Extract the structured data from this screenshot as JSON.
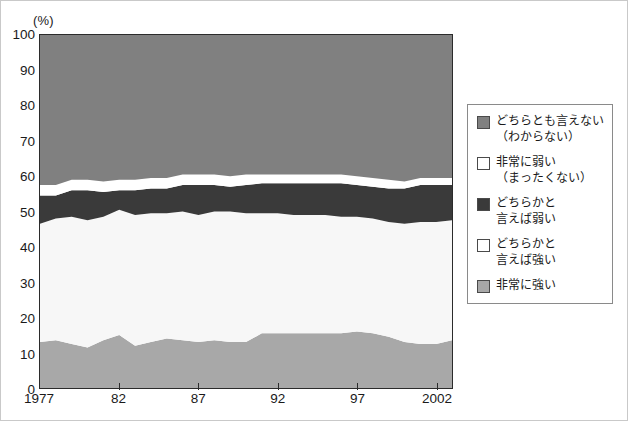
{
  "figure": {
    "unit_label": "(%)",
    "colors": {
      "band_dontknow": "#808080",
      "band_very_weak": "#ffffff",
      "band_somewhat_weak": "#3a3a3a",
      "band_somewhat_strong": "#f7f7f7",
      "band_very_strong": "#a8a8a8",
      "axis": "#2b2b2b",
      "legend_border": "#8a8a8a"
    }
  },
  "legend": {
    "items": [
      {
        "label": "どちらとも言えない\n（わからない）",
        "swatch": "#808080",
        "name": "legend-dontknow"
      },
      {
        "label": "非常に弱い\n（まったくない）",
        "swatch": "#ffffff",
        "name": "legend-very-weak"
      },
      {
        "label": "どちらかと\n言えば弱い",
        "swatch": "#3a3a3a",
        "name": "legend-somewhat-weak"
      },
      {
        "label": "どちらかと\n言えば強い",
        "swatch": "#ffffff",
        "name": "legend-somewhat-strong"
      },
      {
        "label": "非常に強い",
        "swatch": "#a8a8a8",
        "name": "legend-very-strong"
      }
    ]
  },
  "chart_data": {
    "type": "area",
    "stacked": true,
    "title": "",
    "subtitle": "",
    "xlabel": "",
    "ylabel": "(%)",
    "ylim": [
      0,
      100
    ],
    "xlim": [
      1977,
      2003
    ],
    "grid": false,
    "legend_position": "right",
    "y_ticks": [
      0,
      10,
      20,
      30,
      40,
      50,
      60,
      70,
      80,
      90,
      100
    ],
    "y_ticklabels": [
      "0",
      "10",
      "20",
      "30",
      "40",
      "50",
      "60",
      "70",
      "80",
      "90",
      "100"
    ],
    "x_ticks": [
      1977,
      1982,
      1987,
      1992,
      1997,
      2002
    ],
    "x_ticklabels": [
      "1977",
      "82",
      "87",
      "92",
      "97",
      "2002"
    ],
    "x": [
      1977,
      1978,
      1979,
      1980,
      1981,
      1982,
      1983,
      1984,
      1985,
      1986,
      1987,
      1988,
      1989,
      1990,
      1991,
      1992,
      1993,
      1994,
      1995,
      1996,
      1997,
      1998,
      1999,
      2000,
      2001,
      2002,
      2003
    ],
    "series": [
      {
        "name": "非常に強い",
        "color": "#a8a8a8",
        "stack_order": 1,
        "values": [
          13.0,
          13.5,
          12.5,
          11.5,
          13.5,
          15.0,
          12.0,
          13.0,
          14.0,
          13.5,
          13.0,
          13.5,
          13.0,
          13.0,
          15.5,
          15.5,
          15.5,
          15.5,
          15.5,
          15.5,
          16.0,
          15.5,
          14.5,
          13.0,
          12.5,
          12.5,
          13.5
        ]
      },
      {
        "name": "どちらかと言えば強い",
        "color": "#f7f7f7",
        "stack_order": 2,
        "values": [
          33.5,
          34.5,
          36.0,
          36.0,
          35.0,
          35.5,
          37.0,
          36.5,
          35.5,
          36.5,
          36.0,
          36.5,
          37.0,
          36.5,
          34.0,
          34.0,
          33.5,
          33.5,
          33.5,
          33.0,
          32.5,
          32.5,
          32.5,
          33.5,
          34.5,
          34.5,
          34.0
        ]
      },
      {
        "name": "どちらかと言えば弱い",
        "color": "#3a3a3a",
        "stack_order": 3,
        "values": [
          8.0,
          6.5,
          7.5,
          8.5,
          7.0,
          5.5,
          7.0,
          7.0,
          7.0,
          7.5,
          8.5,
          7.5,
          7.0,
          8.0,
          8.5,
          8.5,
          9.0,
          9.0,
          9.0,
          9.5,
          9.0,
          9.0,
          9.5,
          10.0,
          10.5,
          10.5,
          10.0
        ]
      },
      {
        "name": "非常に弱い",
        "color": "#ffffff",
        "stack_order": 4,
        "values": [
          3.0,
          3.0,
          3.0,
          3.0,
          3.0,
          3.0,
          3.0,
          3.0,
          3.0,
          3.0,
          3.0,
          3.0,
          3.0,
          3.0,
          2.5,
          2.5,
          2.5,
          2.5,
          2.5,
          2.5,
          2.5,
          2.5,
          2.5,
          2.0,
          2.0,
          2.0,
          2.0
        ]
      },
      {
        "name": "どちらとも言えない（わからない）",
        "color": "#808080",
        "stack_order": 5,
        "values": [
          42.5,
          42.5,
          41.0,
          41.0,
          41.5,
          41.0,
          41.0,
          40.5,
          40.5,
          39.5,
          39.5,
          39.5,
          40.0,
          39.5,
          39.5,
          39.5,
          39.5,
          39.5,
          39.5,
          39.5,
          40.0,
          40.5,
          41.0,
          41.5,
          40.5,
          40.5,
          40.5
        ]
      }
    ]
  }
}
